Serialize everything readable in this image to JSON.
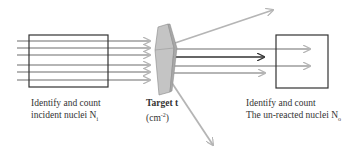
{
  "diagram": {
    "incident": {
      "line1": "Identify and count",
      "line2": "incident nuclei N",
      "sub": "i"
    },
    "target": {
      "line1": "Target t",
      "line2_pre": "(cm",
      "sup": "-2",
      "line2_post": ")"
    },
    "unreacted": {
      "line1": "Identify and count",
      "line2": "The un-reacted nuclei N",
      "sub": "o"
    },
    "colors": {
      "beam": "#b5b5b5",
      "box": "#333333",
      "target_front": "#c4c4c4",
      "target_side": "#a8a8a8",
      "dark_arrow": "#333333"
    }
  }
}
